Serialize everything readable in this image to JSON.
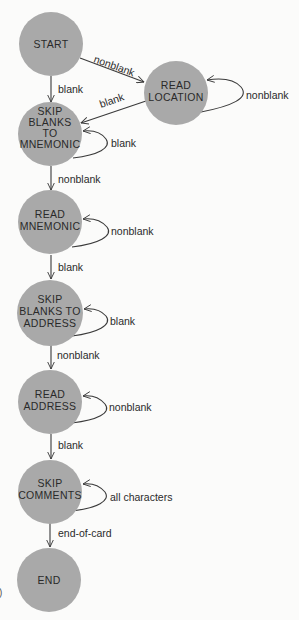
{
  "diagram": {
    "type": "finite-state-machine",
    "colors": {
      "background": "#fbfbfa",
      "state_fill": "#a9a9a9",
      "stroke": "#3a3a3a",
      "text": "#2a2a2a"
    },
    "states": [
      {
        "id": "start",
        "lines": [
          "START"
        ]
      },
      {
        "id": "read_location",
        "lines": [
          "READ",
          "LOCATION"
        ]
      },
      {
        "id": "skip_blanks_to_mnemonic",
        "lines": [
          "SKIP",
          "BLANKS",
          "TO",
          "MNEMONIC"
        ]
      },
      {
        "id": "read_mnemonic",
        "lines": [
          "READ",
          "MNEMONIC"
        ]
      },
      {
        "id": "skip_blanks_to_address",
        "lines": [
          "SKIP",
          "BLANKS TO",
          "ADDRESS"
        ]
      },
      {
        "id": "read_address",
        "lines": [
          "READ",
          "ADDRESS"
        ]
      },
      {
        "id": "skip_comments",
        "lines": [
          "SKIP",
          "COMMENTS"
        ]
      },
      {
        "id": "end",
        "lines": [
          "END"
        ]
      }
    ],
    "transitions": [
      {
        "from": "start",
        "to": "read_location",
        "label": "nonblank"
      },
      {
        "from": "start",
        "to": "skip_blanks_to_mnemonic",
        "label": "blank"
      },
      {
        "from": "read_location",
        "to": "read_location",
        "label": "nonblank"
      },
      {
        "from": "read_location",
        "to": "skip_blanks_to_mnemonic",
        "label": "blank"
      },
      {
        "from": "skip_blanks_to_mnemonic",
        "to": "skip_blanks_to_mnemonic",
        "label": "blank"
      },
      {
        "from": "skip_blanks_to_mnemonic",
        "to": "read_mnemonic",
        "label": "nonblank"
      },
      {
        "from": "read_mnemonic",
        "to": "read_mnemonic",
        "label": "nonblank"
      },
      {
        "from": "read_mnemonic",
        "to": "skip_blanks_to_address",
        "label": "blank"
      },
      {
        "from": "skip_blanks_to_address",
        "to": "skip_blanks_to_address",
        "label": "blank"
      },
      {
        "from": "skip_blanks_to_address",
        "to": "read_address",
        "label": "nonblank"
      },
      {
        "from": "read_address",
        "to": "read_address",
        "label": "nonblank"
      },
      {
        "from": "read_address",
        "to": "skip_comments",
        "label": "blank"
      },
      {
        "from": "skip_comments",
        "to": "skip_comments",
        "label": "all characters"
      },
      {
        "from": "skip_comments",
        "to": "end",
        "label": "end-of-card"
      }
    ],
    "margin_artifact": ")"
  }
}
